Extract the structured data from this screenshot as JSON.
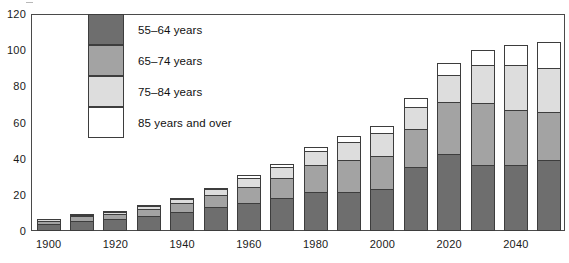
{
  "chart_data": {
    "type": "bar",
    "subtype": "stacked-vertical",
    "title": "",
    "subtitle": "",
    "xlabel": "",
    "ylabel": "",
    "ylim": [
      0,
      120
    ],
    "y_ticks": [
      0,
      20,
      40,
      60,
      80,
      100,
      120
    ],
    "grid": false,
    "legend_position": "inside-upper-left",
    "x": [
      1900,
      1910,
      1920,
      1930,
      1940,
      1950,
      1960,
      1970,
      1980,
      1990,
      2000,
      2010,
      2020,
      2030,
      2040,
      2050
    ],
    "categories": [
      "1900",
      "1910",
      "1920",
      "1930",
      "1940",
      "1950",
      "1960",
      "1970",
      "1980",
      "1990",
      "2000",
      "2010",
      "2020",
      "2030",
      "2040",
      "2050"
    ],
    "x_tick_labels": [
      "1900",
      "1920",
      "1940",
      "1960",
      "1980",
      "2000",
      "2020",
      "2040"
    ],
    "x_tick_values": [
      1900,
      1920,
      1940,
      1960,
      1980,
      2000,
      2020,
      2040
    ],
    "series": [
      {
        "name": "55–64 years",
        "color": "#6e6e6e",
        "values": [
          4.0,
          5.5,
          6.5,
          8.5,
          10.5,
          13.5,
          15.5,
          18.5,
          21.5,
          21.5,
          23.5,
          35.5,
          42.5,
          36.5,
          36.5,
          39.0
        ]
      },
      {
        "name": "65–74 years",
        "color": "#a3a3a3",
        "values": [
          2.0,
          2.8,
          3.0,
          4.0,
          5.0,
          6.5,
          9.0,
          11.0,
          15.5,
          18.0,
          18.5,
          21.0,
          29.0,
          34.5,
          30.5,
          27.0
        ]
      },
      {
        "name": "75–84 years",
        "color": "#dddddd",
        "values": [
          1.0,
          1.2,
          1.5,
          2.0,
          2.5,
          3.5,
          5.5,
          6.5,
          7.5,
          10.0,
          12.5,
          12.5,
          15.5,
          21.5,
          25.5,
          24.5
        ]
      },
      {
        "name": "85 years and over",
        "color": "#ffffff",
        "values": [
          0.4,
          0.5,
          0.6,
          0.8,
          1.0,
          1.2,
          1.5,
          2.0,
          2.5,
          3.5,
          4.5,
          5.5,
          6.5,
          8.5,
          11.0,
          15.0
        ]
      }
    ],
    "totals": [
      7.4,
      10.0,
      11.6,
      15.3,
      19.0,
      24.7,
      31.5,
      38.0,
      47.0,
      53.0,
      59.0,
      74.5,
      93.5,
      101.0,
      103.5,
      105.5
    ]
  },
  "legend": {
    "items": [
      {
        "label": "55–64 years",
        "color": "#6e6e6e"
      },
      {
        "label": "65–74 years",
        "color": "#a3a3a3"
      },
      {
        "label": "75–84 years",
        "color": "#dddddd"
      },
      {
        "label": "85 years and over",
        "color": "#ffffff"
      }
    ]
  },
  "axes": {
    "y": {
      "labels": [
        "120",
        "100",
        "80",
        "60",
        "40",
        "20",
        "0"
      ],
      "values": [
        120,
        100,
        80,
        60,
        40,
        20,
        0
      ]
    },
    "x": {
      "labels": [
        "1900",
        "1920",
        "1940",
        "1960",
        "1980",
        "2000",
        "2020",
        "2040"
      ]
    }
  },
  "colors": {
    "axis": "#4a4a4a",
    "bar_outline": "#3d3d3d",
    "text": "#1a1a1a",
    "background": "#ffffff"
  }
}
